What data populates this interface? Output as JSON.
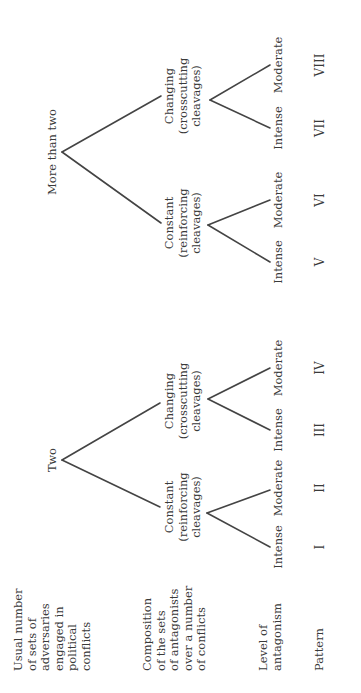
{
  "row_labels": {
    "adversaries": "Usual number\nof sets of\nadversaries\nengaged in\npolitical\nconflicts",
    "composition": "Composition\nof the sets\nof antagonists\nover a number\nof conflicts",
    "antagonism": "Level of\nantagonism",
    "pattern": "Pattern"
  },
  "tree": {
    "two": {
      "label": "Two",
      "constant": {
        "l1": "Constant",
        "l2": "(reinforcing",
        "l3": "cleavages)",
        "intense": "Intense",
        "moderate": "Moderate"
      },
      "changing": {
        "l1": "Changing",
        "l2": "(crosscutting",
        "l3": "cleavages)",
        "intense": "Intense",
        "moderate": "Moderate"
      }
    },
    "more": {
      "label": "More than two",
      "constant": {
        "l1": "Constant",
        "l2": "(reinforcing",
        "l3": "cleavages)",
        "intense": "Intense",
        "moderate": "Moderate"
      },
      "changing": {
        "l1": "Changing",
        "l2": "(crosscutting",
        "l3": "cleavages)",
        "intense": "Intense",
        "moderate": "Moderate"
      }
    }
  },
  "patterns": [
    "I",
    "II",
    "III",
    "IV",
    "V",
    "VI",
    "VII",
    "VIII"
  ]
}
